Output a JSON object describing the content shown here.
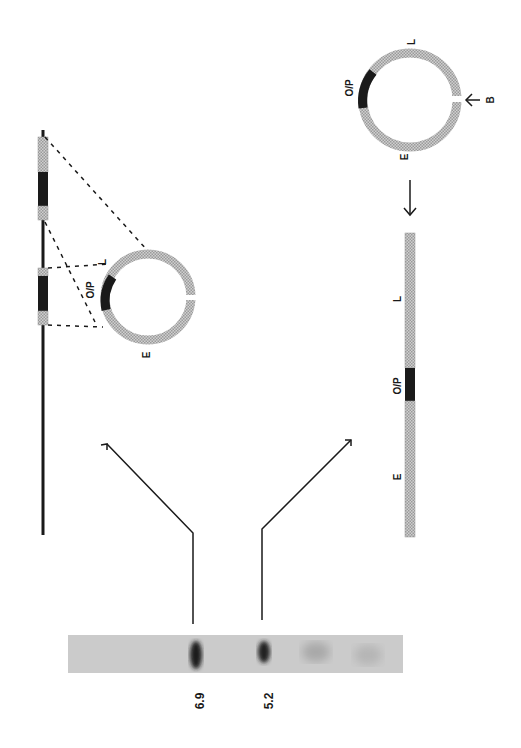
{
  "figure": {
    "gel": {
      "band_labels": [
        "6.9",
        "5.2"
      ],
      "strip_color": "#c9c9c9",
      "band_color": "#1e1e1e"
    },
    "genomic_map": {
      "segment_labels": {
        "left_end": "L",
        "right_end": "E",
        "operator": "O/P"
      }
    },
    "circular_plasmid_top": {
      "labels": {
        "l": "L",
        "e": "E",
        "op": "O/P"
      }
    },
    "circular_plasmid_right": {
      "labels": {
        "l": "L",
        "e": "E",
        "op": "O/P",
        "site": "B"
      }
    },
    "linear_map": {
      "labels": {
        "l": "L",
        "op": "O/P",
        "e": "E"
      }
    },
    "colors": {
      "hatch": "#b8b8b8",
      "dark": "#1a1a1a",
      "line": "#222222"
    }
  }
}
